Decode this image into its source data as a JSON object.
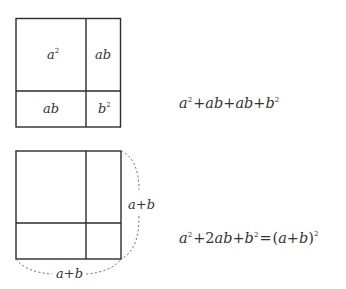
{
  "diagram": {
    "top_square": {
      "cells": [
        {
          "id": "top-left",
          "base": "a",
          "exp": "2"
        },
        {
          "id": "top-right",
          "base": "ab",
          "exp": ""
        },
        {
          "id": "bottom-left",
          "base": "ab",
          "exp": ""
        },
        {
          "id": "bottom-right",
          "base": "b",
          "exp": "2"
        }
      ],
      "formula": {
        "parts": [
          "a",
          "2",
          "+",
          "ab",
          "+",
          "ab",
          "+",
          "b",
          "2"
        ],
        "text": "a²+ab+ab+b²"
      }
    },
    "bottom_square": {
      "side_label_right": {
        "a": "a",
        "plus": "+",
        "b": "b"
      },
      "side_label_bottom": {
        "a": "a",
        "plus": "+",
        "b": "b"
      },
      "formula": {
        "text": "a²+2ab+b²=(a+b)²",
        "t1_base": "a",
        "t1_exp": "2",
        "plus1": "+",
        "t2_coef": "2",
        "t2_base": "ab",
        "plus2": "+",
        "t3_base": "b",
        "t3_exp": "2",
        "equals": "=",
        "lparen": "(",
        "inner_a": "a",
        "inner_plus": "+",
        "inner_b": "b",
        "rparen": ")",
        "outer_exp": "2"
      }
    },
    "colors": {
      "line": "#2b2b2b",
      "dashed": "#6a6a6a",
      "text": "#333333",
      "background": "#ffffff"
    }
  }
}
